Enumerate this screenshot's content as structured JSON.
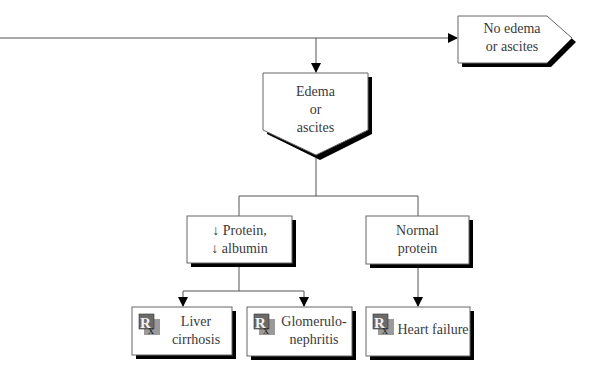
{
  "nodes": {
    "no_edema": {
      "lines": [
        "No edema",
        "or ascites"
      ]
    },
    "edema": {
      "lines": [
        "Edema",
        "or",
        "ascites"
      ]
    },
    "low_protein": {
      "lines": [
        "↓ Protein,",
        "↓ albumin"
      ]
    },
    "normal_protein": {
      "lines": [
        "Normal",
        "protein"
      ]
    },
    "liver": {
      "lines": [
        "Liver",
        "cirrhosis"
      ],
      "icon": "rx-diagnosis-icon"
    },
    "glomerulo": {
      "lines": [
        "Glomerulo-",
        "nephritis"
      ],
      "icon": "rx-diagnosis-icon"
    },
    "heart": {
      "lines": [
        "Heart failure"
      ],
      "icon": "rx-diagnosis-icon"
    }
  },
  "colors": {
    "line": "#555555",
    "shadow": "#000000",
    "box_border": "#666666",
    "icon_bg": "#8a8a8a",
    "icon_dark": "#4a4a4a"
  }
}
